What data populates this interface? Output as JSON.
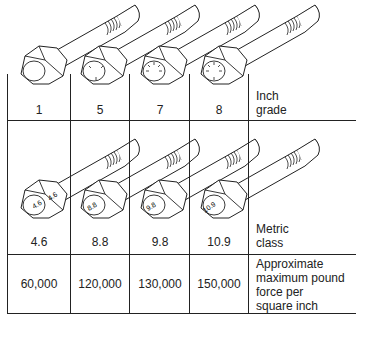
{
  "diagram": {
    "inch_grade": {
      "row_label_line1": "Inch",
      "row_label_line2": "grade",
      "grades": [
        "1",
        "5",
        "7",
        "8"
      ],
      "head_marks": [
        0,
        3,
        5,
        6
      ]
    },
    "metric_class": {
      "row_label_line1": "Metric",
      "row_label_line2": "class",
      "classes": [
        "4.6",
        "8.8",
        "9.8",
        "10.9"
      ],
      "head_marks": [
        "4.6",
        "8.8",
        "9.8",
        "10.9"
      ]
    },
    "strength": {
      "row_label_line1": "Approximate",
      "row_label_line2": "maximum pound",
      "row_label_line3": "force per",
      "row_label_line4": "square inch",
      "values": [
        "60,000",
        "120,000",
        "130,000",
        "150,000"
      ]
    },
    "colors": {
      "line": "#222222",
      "background": "#ffffff"
    }
  }
}
